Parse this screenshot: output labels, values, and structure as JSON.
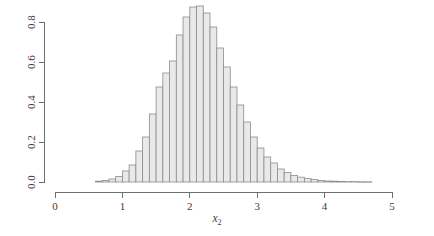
{
  "chart_data": {
    "type": "bar",
    "title": "",
    "subtitle": "",
    "xlabel": "x2",
    "xlabel_base": "x",
    "xlabel_sub": "2",
    "ylabel": "",
    "xlim": [
      0,
      5.2
    ],
    "ylim": [
      0,
      0.9
    ],
    "grid": false,
    "legend": null,
    "annotations": [],
    "bin_width": 0.1,
    "bar_fill": "#e9e9e9",
    "bar_stroke": "#8c8c8c",
    "axis_color": "#6f6f6f",
    "background": "#ffffff",
    "x_ticks": [
      0,
      1,
      2,
      3,
      4,
      5
    ],
    "x_tick_labels": [
      "0",
      "1",
      "2",
      "3",
      "4",
      "5"
    ],
    "y_ticks": [
      0.0,
      0.2,
      0.4,
      0.6,
      0.8
    ],
    "y_tick_labels": [
      "0.0",
      "0.2",
      "0.4",
      "0.6",
      "0.8"
    ],
    "bin_edges": [
      0.6,
      0.7,
      0.8,
      0.9,
      1.0,
      1.1,
      1.2,
      1.3,
      1.4,
      1.5,
      1.6,
      1.7,
      1.8,
      1.9,
      2.0,
      2.1,
      2.2,
      2.3,
      2.4,
      2.5,
      2.6,
      2.7,
      2.8,
      2.9,
      3.0,
      3.1,
      3.2,
      3.3,
      3.4,
      3.5,
      3.6,
      3.7,
      3.8,
      3.9,
      4.0,
      4.1,
      4.2,
      4.3,
      4.4,
      4.5,
      4.6,
      4.7
    ],
    "x_centers": [
      0.65,
      0.75,
      0.85,
      0.95,
      1.05,
      1.15,
      1.25,
      1.35,
      1.45,
      1.55,
      1.65,
      1.75,
      1.85,
      1.95,
      2.05,
      2.15,
      2.25,
      2.35,
      2.45,
      2.55,
      2.65,
      2.75,
      2.85,
      2.95,
      3.05,
      3.15,
      3.25,
      3.35,
      3.45,
      3.55,
      3.65,
      3.75,
      3.85,
      3.95,
      4.05,
      4.15,
      4.25,
      4.35,
      4.45,
      4.55,
      4.65
    ],
    "values": [
      0.004,
      0.008,
      0.015,
      0.028,
      0.055,
      0.085,
      0.155,
      0.225,
      0.34,
      0.475,
      0.545,
      0.605,
      0.735,
      0.825,
      0.875,
      0.88,
      0.845,
      0.775,
      0.67,
      0.575,
      0.475,
      0.385,
      0.3,
      0.225,
      0.17,
      0.125,
      0.095,
      0.065,
      0.048,
      0.033,
      0.024,
      0.017,
      0.012,
      0.008,
      0.005,
      0.004,
      0.003,
      0.002,
      0.002,
      0.001,
      0.001
    ],
    "peak_value": 0.88,
    "peak_x": 2.15
  },
  "plot": {
    "description": "Histogram of x2"
  }
}
